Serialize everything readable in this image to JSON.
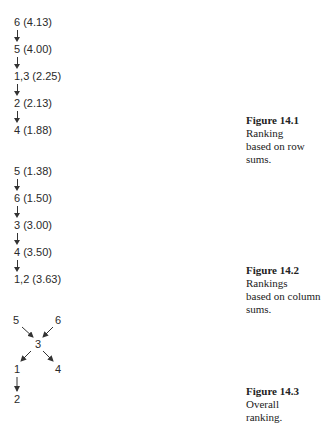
{
  "figures": [
    {
      "number": "Figure 14.1",
      "caption_rest_1": "Ranking",
      "caption_rest_2": "based on row sums.",
      "nodes": [
        "6 (4.13)",
        "5 (4.00)",
        "1,3 (2.25)",
        "2 (2.13)",
        "4 (1.88)"
      ]
    },
    {
      "number": "Figure 14.2",
      "caption_rest_1": "Rankings",
      "caption_rest_2": "based on column sums.",
      "nodes": [
        "5 (1.38)",
        "6 (1.50)",
        "3 (3.00)",
        "4 (3.50)",
        "1,2 (3.63)"
      ]
    },
    {
      "number": "Figure 14.3",
      "caption_rest_1": "Overall",
      "caption_rest_2": "ranking.",
      "nodes": {
        "top_left": "5",
        "top_right": "6",
        "center": "3",
        "bottom_left": "1",
        "bottom_right": "4",
        "last": "2"
      }
    }
  ]
}
